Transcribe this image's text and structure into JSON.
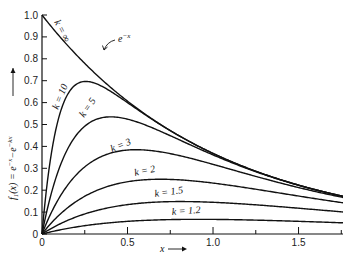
{
  "chart_data": {
    "type": "line",
    "title": "",
    "xlabel": "x →",
    "ylabel": "f₁(x) = e^{-x} − e^{-kx} →",
    "xlim": [
      0,
      1.76
    ],
    "ylim": [
      0,
      1.0
    ],
    "grid": false,
    "legend": "inline curve labels",
    "x_ticks": [
      0,
      0.25,
      0.5,
      0.75,
      1.0,
      1.25,
      1.5,
      1.75
    ],
    "x_tick_labels": [
      "0",
      "",
      "0.5",
      "",
      "1.0",
      "",
      "1.5",
      ""
    ],
    "y_ticks": [
      0,
      0.1,
      0.2,
      0.3,
      0.4,
      0.5,
      0.6,
      0.7,
      0.8,
      0.9,
      1.0
    ],
    "y_tick_labels": [
      "0",
      "0.1",
      "0.2",
      "0.3",
      "0.4",
      "0.5",
      "0.6",
      "0.7",
      "0.8",
      "0.9",
      "1.0"
    ],
    "formula": "f(x) = e^(-x) - e^(-k x)",
    "series": [
      {
        "name": "k = ∞",
        "k": "inf",
        "label": "k = ∞",
        "peak": {
          "x": 0,
          "y": 1.0
        }
      },
      {
        "name": "k = 10",
        "k": 10,
        "label": "k = 10",
        "peak": {
          "x": 0.26,
          "y": 0.7
        }
      },
      {
        "name": "k = 5",
        "k": 5,
        "label": "k = 5",
        "peak": {
          "x": 0.4,
          "y": 0.53
        }
      },
      {
        "name": "k = 3",
        "k": 3,
        "label": "k = 3",
        "peak": {
          "x": 0.55,
          "y": 0.38
        }
      },
      {
        "name": "k = 2",
        "k": 2,
        "label": "k = 2",
        "peak": {
          "x": 0.69,
          "y": 0.25
        }
      },
      {
        "name": "k = 1.5",
        "k": 1.5,
        "label": "k = 1.5",
        "peak": {
          "x": 0.81,
          "y": 0.15
        }
      },
      {
        "name": "k = 1.2",
        "k": 1.2,
        "label": "k = 1.2",
        "peak": {
          "x": 0.91,
          "y": 0.07
        }
      }
    ],
    "annotations": [
      {
        "text": "e^{-x}",
        "points_to": "k = ∞ curve near x≈0.55"
      }
    ]
  },
  "labels": {
    "y_axis": "f",
    "y_axis_sub": "1",
    "y_axis_rest": "(x) = e",
    "y_axis_exp1": "−x",
    "y_axis_minus": "−e",
    "y_axis_exp2": "−kx",
    "x_axis": "x",
    "annotation_base": "e",
    "annotation_exp": "−x",
    "curves": [
      "k = ∞",
      "k = 10",
      "k = 5",
      "k = 3",
      "k = 2",
      "k = 1.5",
      "k = 1.2"
    ]
  }
}
